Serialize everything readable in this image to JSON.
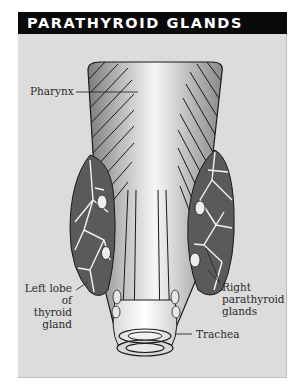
{
  "figure": {
    "title": "PARATHYROID GLANDS",
    "colors": {
      "header_background": "#0a0a0a",
      "header_text": "#ffffff",
      "panel_background": "#dcdcdc",
      "gland_fill": "#5a5a5a",
      "vessel_color": "#f4f4f4",
      "outline": "#1a1a1a"
    },
    "labels": {
      "pharynx": "Pharynx",
      "left_lobe_line1": "Left lobe",
      "left_lobe_line2": "of thyroid",
      "left_lobe_line3": "gland",
      "right_parathyroid_line1": "Right",
      "right_parathyroid_line2": "parathyroid",
      "right_parathyroid_line3": "glands",
      "trachea": "Trachea"
    }
  }
}
